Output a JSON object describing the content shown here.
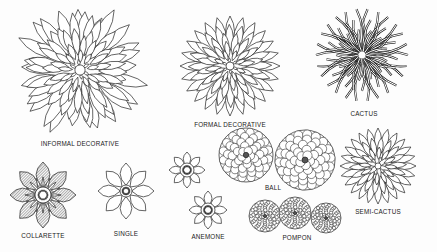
{
  "figure": {
    "labels": {
      "informal_decorative": "INFORMAL DECORATIVE",
      "formal_decorative": "FORMAL DECORATIVE",
      "cactus": "CACTUS",
      "collarette": "COLLARETTE",
      "single": "SINGLE",
      "anemone": "ANEMONE",
      "ball": "BALL",
      "pompon": "POMPON",
      "semi_cactus": "SEMI-CACTUS"
    },
    "colors": {
      "ink": "#222222",
      "paper": "#fdfdfd"
    }
  }
}
